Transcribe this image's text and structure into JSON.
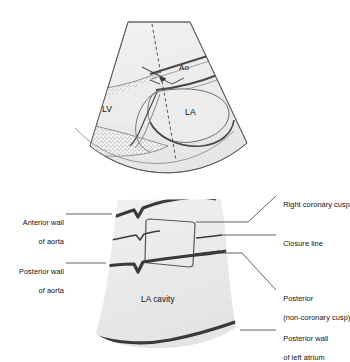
{
  "figure": {
    "title_alt": "Echocardiographic aortic root: sector view and M-mode schematic",
    "colors": {
      "cavity_fill": "#ececec",
      "sector_fill": "#ededed",
      "wall_dark": "#3a3a3a",
      "outline": "#555555",
      "leader": "#3c3c3c",
      "text": "#111111",
      "stipple": "#707070"
    }
  },
  "sector_panel": {
    "name": "parasternal-long-axis-sector",
    "inline_labels": [
      {
        "key": "lv",
        "text": "LV"
      },
      {
        "key": "la",
        "text": "LA"
      },
      {
        "key": "ao",
        "text": "Ao"
      }
    ],
    "cursor_line_style": "dashed"
  },
  "mmode_panel": {
    "name": "m-mode-aortic-root-tracing",
    "inline_labels": [
      {
        "key": "la_cavity",
        "text": "LA cavity"
      }
    ],
    "left_labels": [
      {
        "key": "anterior_wall_aorta",
        "line1": "Anterior wall",
        "line2": "of aorta"
      },
      {
        "key": "posterior_wall_aorta",
        "line1": "Posterior wall",
        "line2": "of aorta"
      }
    ],
    "right_labels": [
      {
        "key": "right_coronary_cusp",
        "line1": "Right coronary cusp",
        "line2": ""
      },
      {
        "key": "closure_line",
        "line1": "Closure line",
        "line2": ""
      },
      {
        "key": "posterior_non_coronary_cusp",
        "line1": "Posterior",
        "line2": "(non-coronary cusp)"
      },
      {
        "key": "posterior_wall_left_atrium",
        "line1": "Posterior wall",
        "line2": "of left atrium"
      }
    ]
  }
}
